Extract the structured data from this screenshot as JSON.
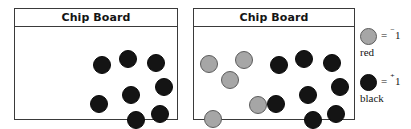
{
  "boards": [
    {
      "id": "board-left",
      "title": "Chip Board",
      "x": 14,
      "y": 8,
      "width": 164,
      "height": 112,
      "chips": [
        {
          "color": "black",
          "x": 78,
          "y": 28,
          "size": 18
        },
        {
          "color": "black",
          "x": 104,
          "y": 22,
          "size": 18
        },
        {
          "color": "black",
          "x": 132,
          "y": 26,
          "size": 18
        },
        {
          "color": "black",
          "x": 140,
          "y": 50,
          "size": 18
        },
        {
          "color": "black",
          "x": 107,
          "y": 58,
          "size": 18
        },
        {
          "color": "black",
          "x": 75,
          "y": 67,
          "size": 18
        },
        {
          "color": "black",
          "x": 112,
          "y": 83,
          "size": 18
        },
        {
          "color": "black",
          "x": 136,
          "y": 77,
          "size": 18
        }
      ]
    },
    {
      "id": "board-right",
      "title": "Chip Board",
      "x": 193,
      "y": 8,
      "width": 162,
      "height": 112,
      "chips": [
        {
          "color": "gray",
          "x": 6,
          "y": 27,
          "size": 18
        },
        {
          "color": "gray",
          "x": 41,
          "y": 23,
          "size": 18
        },
        {
          "color": "gray",
          "x": 27,
          "y": 43,
          "size": 18
        },
        {
          "color": "gray",
          "x": 55,
          "y": 68,
          "size": 18
        },
        {
          "color": "gray",
          "x": 10,
          "y": 82,
          "size": 18
        },
        {
          "color": "black",
          "x": 76,
          "y": 28,
          "size": 18
        },
        {
          "color": "black",
          "x": 101,
          "y": 22,
          "size": 18
        },
        {
          "color": "black",
          "x": 129,
          "y": 26,
          "size": 18
        },
        {
          "color": "black",
          "x": 137,
          "y": 50,
          "size": 18
        },
        {
          "color": "black",
          "x": 105,
          "y": 58,
          "size": 18
        },
        {
          "color": "black",
          "x": 73,
          "y": 67,
          "size": 18
        },
        {
          "color": "black",
          "x": 110,
          "y": 83,
          "size": 18
        },
        {
          "color": "black",
          "x": 133,
          "y": 77,
          "size": 18
        }
      ]
    }
  ],
  "legend": {
    "rows": [
      {
        "swatch": "gray-chip-icon",
        "color": "gray",
        "sign": "⁻",
        "magnitude": "1",
        "equals": "=",
        "name": "red",
        "top": 0
      },
      {
        "swatch": "black-chip-icon",
        "color": "black",
        "sign": "⁺",
        "magnitude": "1",
        "equals": "=",
        "name": "black",
        "top": 46
      }
    ]
  },
  "colors": {
    "chip_black": "#141414",
    "chip_gray": "#a6a6a6",
    "chip_gray_border": "#5c5c5c",
    "board_border": "#3a3a3a",
    "background": "#ffffff",
    "text": "#141414"
  }
}
